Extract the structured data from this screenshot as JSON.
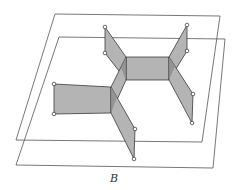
{
  "figure": {
    "label": "B",
    "label_position": {
      "x": 110,
      "y": 172
    },
    "colors": {
      "plane_stroke": "#555555",
      "face_fill": "#b4b4b4",
      "face_dark_fill": "#8e8e8e",
      "edge_stroke": "#1a1a1a",
      "vertex_fill": "#ffffff"
    },
    "planes": [
      {
        "name": "upper-plane",
        "points": [
          [
            55,
            14
          ],
          [
            220,
            16
          ],
          [
            202,
            142
          ],
          [
            16,
            140
          ]
        ]
      },
      {
        "name": "lower-plane",
        "points": [
          [
            59,
            37
          ],
          [
            225,
            39
          ],
          [
            213,
            168
          ],
          [
            16,
            165
          ]
        ]
      }
    ],
    "faces": [
      {
        "name": "upper-left-flap",
        "shade": "light",
        "points": [
          [
            105,
            27
          ],
          [
            126,
            57
          ],
          [
            126,
            80
          ],
          [
            105,
            53
          ]
        ]
      },
      {
        "name": "upper-right-flap",
        "shade": "light",
        "points": [
          [
            187,
            25
          ],
          [
            169,
            57
          ],
          [
            169,
            80
          ],
          [
            187,
            51
          ]
        ]
      },
      {
        "name": "central-rectangle",
        "shade": "light",
        "points": [
          [
            126,
            57
          ],
          [
            169,
            57
          ],
          [
            169,
            80
          ],
          [
            126,
            80
          ]
        ]
      },
      {
        "name": "lower-right-flap",
        "shade": "light",
        "points": [
          [
            169,
            57
          ],
          [
            193,
            94
          ],
          [
            192,
            123
          ],
          [
            169,
            80
          ]
        ]
      },
      {
        "name": "connector-flap",
        "shade": "light",
        "points": [
          [
            126,
            57
          ],
          [
            126,
            80
          ],
          [
            111,
            113
          ],
          [
            111,
            87
          ]
        ]
      },
      {
        "name": "left-rectangle",
        "shade": "light",
        "points": [
          [
            54,
            84
          ],
          [
            111,
            87
          ],
          [
            111,
            113
          ],
          [
            54,
            114
          ]
        ]
      },
      {
        "name": "lower-flap",
        "shade": "light",
        "points": [
          [
            111,
            87
          ],
          [
            135,
            129
          ],
          [
            134,
            159
          ],
          [
            111,
            113
          ]
        ]
      }
    ],
    "overlaps": [
      {
        "name": "overlap-central-left",
        "points": [
          [
            121,
            68
          ],
          [
            126,
            57
          ],
          [
            126,
            80
          ]
        ]
      },
      {
        "name": "overlap-central-right",
        "points": [
          [
            169,
            57
          ],
          [
            175,
            66
          ],
          [
            169,
            80
          ]
        ]
      },
      {
        "name": "overlap-left-junction",
        "points": [
          [
            111,
            87
          ],
          [
            117,
            97
          ],
          [
            111,
            113
          ]
        ]
      }
    ],
    "vertices": [
      [
        105,
        27
      ],
      [
        105,
        53
      ],
      [
        187,
        25
      ],
      [
        187,
        51
      ],
      [
        193,
        94
      ],
      [
        192,
        123
      ],
      [
        54,
        84
      ],
      [
        54,
        114
      ],
      [
        135,
        129
      ],
      [
        134,
        159
      ]
    ]
  }
}
